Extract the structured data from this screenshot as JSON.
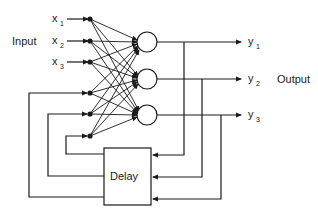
{
  "diagram": {
    "input_label": "Input",
    "output_label": "Output",
    "delay_label": "Delay",
    "inputs": [
      {
        "name": "x",
        "sub": "1"
      },
      {
        "name": "x",
        "sub": "2"
      },
      {
        "name": "x",
        "sub": "3"
      }
    ],
    "outputs": [
      {
        "name": "y",
        "sub": "1"
      },
      {
        "name": "y",
        "sub": "2"
      },
      {
        "name": "y",
        "sub": "3"
      }
    ],
    "colors": {
      "stroke": "#1a1a1a",
      "background": "#ffffff"
    }
  }
}
